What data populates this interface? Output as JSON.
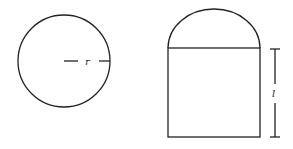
{
  "figure": {
    "left_shape": {
      "type": "circle",
      "radius_label": "r"
    },
    "right_shape": {
      "type": "rectangle-with-semicircle-top",
      "length_label": "l"
    },
    "stroke_color": "#222222",
    "background": "#ffffff"
  }
}
